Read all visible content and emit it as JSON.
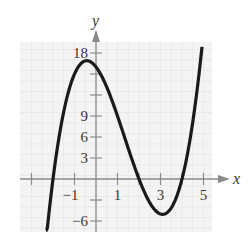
{
  "chart_data": {
    "type": "line",
    "title": "",
    "xlabel": "x",
    "ylabel": "y",
    "function": "f(x) = (x + 2)(x - 2)(x - 4)",
    "xlim": [
      -3.5,
      5.5
    ],
    "ylim": [
      -7.3,
      19
    ],
    "grid": true,
    "x_ticks": [
      -3,
      -2,
      -1,
      0,
      1,
      2,
      3,
      4,
      5
    ],
    "x_tick_labels": [
      {
        "value": -1,
        "label": "−1"
      },
      {
        "value": 1,
        "label": "1"
      },
      {
        "value": 3,
        "label": "3"
      },
      {
        "value": 5,
        "label": "5"
      }
    ],
    "y_ticks": [
      -6,
      -3,
      3,
      6,
      9,
      12,
      15,
      18
    ],
    "y_tick_labels": [
      {
        "value": 18,
        "label": "18"
      },
      {
        "value": 9,
        "label": "9"
      },
      {
        "value": 6,
        "label": "6"
      },
      {
        "value": 3,
        "label": "3"
      },
      {
        "value": -6,
        "label": "−6"
      }
    ],
    "series": [
      {
        "name": "f(x)",
        "x": [
          -2.33,
          -2,
          -1.5,
          -1,
          -0.5,
          0,
          0.5,
          1,
          1.5,
          2,
          2.5,
          3,
          3.5,
          4,
          4.5,
          4.93
        ],
        "y": [
          -7.3,
          0,
          6.875,
          15,
          16.875,
          16,
          13.125,
          9,
          4.375,
          0,
          -3.375,
          -5,
          -4.125,
          0,
          8.125,
          18.9
        ]
      }
    ],
    "key_points": {
      "local_max": {
        "x": -0.5,
        "y": 16.9
      },
      "local_min": {
        "x": 3.1,
        "y": -5
      },
      "roots": [
        -2,
        2,
        4
      ]
    }
  }
}
